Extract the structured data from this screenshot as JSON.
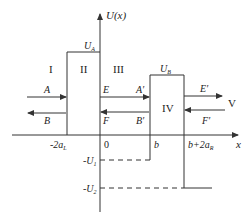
{
  "diagram": {
    "type": "potential-energy-profile",
    "axes": {
      "y_label": "U(x)",
      "x_label": "x",
      "origin_label": "0"
    },
    "x_ticks": [
      {
        "label_main": "-2a",
        "label_sub": "L"
      },
      {
        "label_main": "0",
        "label_sub": ""
      },
      {
        "label_main": "b",
        "label_sub": ""
      },
      {
        "label_main": "b+2a",
        "label_sub": "R"
      }
    ],
    "y_ticks": [
      {
        "label_main": "-U",
        "label_sub": "1"
      },
      {
        "label_main": "-U",
        "label_sub": "2"
      }
    ],
    "barriers": [
      {
        "label_main": "U",
        "label_sub": "A"
      },
      {
        "label_main": "U",
        "label_sub": "B"
      }
    ],
    "regions": [
      "I",
      "II",
      "III",
      "IV",
      "V"
    ],
    "waves": {
      "A": "A",
      "B": "B",
      "E": "E",
      "F": "F",
      "A_prime": "A′",
      "B_prime": "B′",
      "E_prime": "E′",
      "F_prime": "F′"
    },
    "colors": {
      "line": "#333333",
      "text": "#222222",
      "background": "#ffffff"
    }
  }
}
